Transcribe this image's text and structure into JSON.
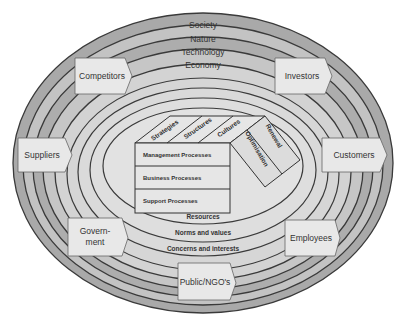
{
  "diagram": {
    "outer_rings": [
      "Society",
      "Nature",
      "Technology",
      "Economy"
    ],
    "stakeholders": [
      "Competitors",
      "Investors",
      "Suppliers",
      "Customers",
      "Govern-",
      "ment",
      "Employees",
      "Public/NGO's"
    ],
    "inner_rings": [
      "Resources",
      "Norms and values",
      "Concerns and interests"
    ],
    "cube_top": [
      "Strategies",
      "Structures",
      "Cultures"
    ],
    "cube_side": [
      "Optimisation",
      "Renewal"
    ],
    "processes": [
      "Management Processes",
      "Business Processes",
      "Support Processes"
    ]
  },
  "colors": {
    "ring_dark": "#a8a8a8",
    "ring_light": "#c4c4c4",
    "core": "#dcdcdc",
    "box": "#e4e4e4",
    "line": "#333333"
  }
}
